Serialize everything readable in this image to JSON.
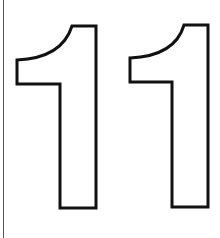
{
  "graphic": {
    "text": "11",
    "style": "outlined-digits",
    "stroke_color": "#111111",
    "fill_color": "#ffffff",
    "rule_color": "#555555"
  }
}
